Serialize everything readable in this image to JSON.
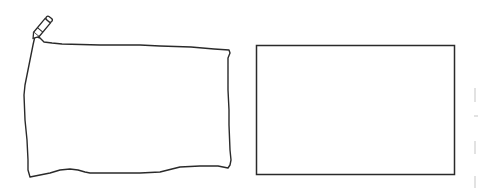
{
  "canvas": {
    "background": "#ffffff",
    "stroke_color": "#2a2a2a",
    "tool": "pencil-icon"
  },
  "shapes": [
    {
      "type": "freehand-rectangle",
      "label": "hand-drawn rectangle"
    },
    {
      "type": "rectangle",
      "label": "straight rectangle",
      "x": 256,
      "y": 45,
      "width": 198,
      "height": 129
    }
  ]
}
